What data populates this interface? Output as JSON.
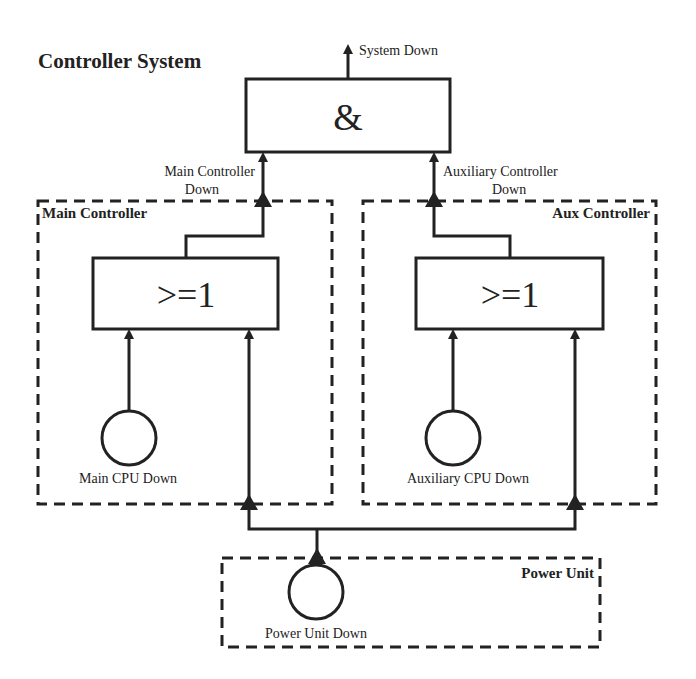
{
  "diagram": {
    "title": "Controller System",
    "top_event": "System Down",
    "gates": {
      "and_gate": {
        "symbol": "&"
      },
      "main_or_gate": {
        "symbol": ">=1"
      },
      "aux_or_gate": {
        "symbol": ">=1"
      }
    },
    "intermediate_events": {
      "main_line1": "Main Controller",
      "main_line2": "Down",
      "aux_line1": "Auxiliary Controller",
      "aux_line2": "Down"
    },
    "groups": {
      "main": "Main Controller",
      "aux": "Aux Controller",
      "power": "Power Unit"
    },
    "basic_events": {
      "main_cpu": "Main CPU Down",
      "aux_cpu": "Auxiliary CPU Down",
      "power_unit": "Power Unit Down"
    },
    "colors": {
      "stroke": "#222222",
      "background": "#ffffff"
    }
  }
}
